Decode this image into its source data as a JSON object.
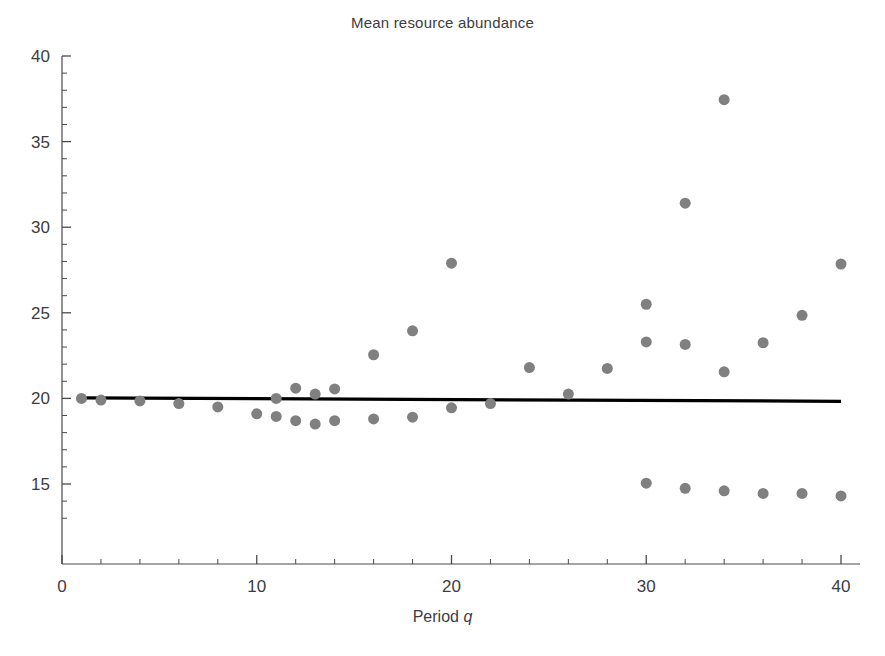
{
  "chart_data": {
    "type": "scatter",
    "title": "Mean resource abundance",
    "xlabel": "Period q",
    "xlabel_plain": "Period",
    "xlabel_italic": "q",
    "ylabel": "",
    "xlim": [
      0,
      41
    ],
    "ylim": [
      12.6,
      40
    ],
    "grid": false,
    "legend": null,
    "xticks": [
      0,
      10,
      20,
      30,
      40
    ],
    "xticklabels": [
      "0",
      "10",
      "20",
      "30",
      "40"
    ],
    "yticks": [
      15,
      20,
      25,
      30,
      35,
      40
    ],
    "yticklabels": [
      "15",
      "20",
      "25",
      "30",
      "35",
      "40"
    ],
    "minor_tick_step_x": 2,
    "minor_tick_step_y": 1,
    "marker_color": "#808080",
    "marker_size": 11,
    "trendline_color": "#000000",
    "x": [
      1,
      2,
      4,
      6,
      8,
      10,
      11,
      11,
      12,
      12,
      13,
      13,
      14,
      14,
      16,
      16,
      18,
      18,
      20,
      20,
      22,
      22,
      24,
      26,
      28,
      30,
      30,
      30,
      32,
      32,
      32,
      34,
      34,
      36,
      36,
      38,
      38,
      40,
      40
    ],
    "y": [
      20.0,
      19.9,
      19.85,
      19.7,
      19.5,
      19.1,
      20.0,
      20.6,
      18.7,
      20.3,
      18.5,
      20.2,
      18.7,
      20.55,
      18.8,
      22.55,
      18.9,
      23.95,
      19.45,
      27.9,
      19.7,
      19.7,
      21.8,
      20.25,
      21.75,
      15.05,
      20.0,
      25.5,
      14.75,
      23.15,
      31.4,
      14.6,
      37.45,
      14.45,
      23.25,
      14.45,
      24.85,
      14.3,
      27.85
    ],
    "points": [
      {
        "x": 1,
        "y": 20.0
      },
      {
        "x": 2,
        "y": 19.9
      },
      {
        "x": 4,
        "y": 19.85
      },
      {
        "x": 6,
        "y": 19.7
      },
      {
        "x": 8,
        "y": 19.5
      },
      {
        "x": 10,
        "y": 19.1
      },
      {
        "x": 11,
        "y": 20.0
      },
      {
        "x": 11,
        "y": 18.95
      },
      {
        "x": 12,
        "y": 20.6
      },
      {
        "x": 12,
        "y": 18.7
      },
      {
        "x": 13,
        "y": 20.25
      },
      {
        "x": 13,
        "y": 18.5
      },
      {
        "x": 14,
        "y": 20.55
      },
      {
        "x": 14,
        "y": 18.7
      },
      {
        "x": 16,
        "y": 22.55
      },
      {
        "x": 16,
        "y": 18.8
      },
      {
        "x": 18,
        "y": 23.95
      },
      {
        "x": 18,
        "y": 18.9
      },
      {
        "x": 20,
        "y": 27.9
      },
      {
        "x": 20,
        "y": 19.45
      },
      {
        "x": 22,
        "y": 19.7
      },
      {
        "x": 24,
        "y": 21.8
      },
      {
        "x": 26,
        "y": 20.25
      },
      {
        "x": 28,
        "y": 21.75
      },
      {
        "x": 30,
        "y": 25.5
      },
      {
        "x": 30,
        "y": 23.3
      },
      {
        "x": 30,
        "y": 15.05
      },
      {
        "x": 32,
        "y": 31.4
      },
      {
        "x": 32,
        "y": 23.15
      },
      {
        "x": 32,
        "y": 14.75
      },
      {
        "x": 34,
        "y": 37.45
      },
      {
        "x": 34,
        "y": 21.55
      },
      {
        "x": 34,
        "y": 14.6
      },
      {
        "x": 36,
        "y": 23.25
      },
      {
        "x": 36,
        "y": 14.45
      },
      {
        "x": 38,
        "y": 24.85
      },
      {
        "x": 38,
        "y": 14.45
      },
      {
        "x": 40,
        "y": 27.85
      },
      {
        "x": 40,
        "y": 14.3
      }
    ],
    "trendline": {
      "name": "fit",
      "x": [
        1,
        40
      ],
      "y": [
        20.03,
        19.83
      ]
    }
  }
}
